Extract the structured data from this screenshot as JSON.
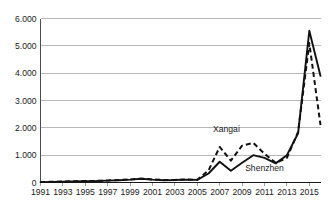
{
  "chart_data": {
    "type": "line",
    "title": "",
    "subtitle": "",
    "xlabel": "",
    "ylabel": "",
    "xlim": [
      1991,
      2016
    ],
    "ylim": [
      0,
      6000
    ],
    "grid": true,
    "grid_axis": "y",
    "legend_position": "inline-annotation",
    "y_ticks": [
      0,
      1000,
      2000,
      3000,
      4000,
      5000,
      6000
    ],
    "y_tick_labels": [
      "0",
      "1.000",
      "2.000",
      "3.000",
      "4.000",
      "5.000",
      "6.000"
    ],
    "x": [
      1991,
      1992,
      1993,
      1994,
      1995,
      1996,
      1997,
      1998,
      1999,
      2000,
      2001,
      2002,
      2003,
      2004,
      2005,
      2006,
      2007,
      2008,
      2009,
      2010,
      2011,
      2012,
      2013,
      2014,
      2015,
      2016
    ],
    "x_tick_labels": [
      "1991",
      "1993",
      "1995",
      "1997",
      "1999",
      "2001",
      "2003",
      "2005",
      "2007",
      "2009",
      "2011",
      "2013",
      "2015"
    ],
    "x_ticks": [
      1991,
      1993,
      1995,
      1997,
      1999,
      2001,
      2003,
      2005,
      2007,
      2009,
      2011,
      2013,
      2015
    ],
    "series": [
      {
        "name": "Xangai",
        "style": "dashed",
        "color": "#111111",
        "values": [
          20,
          25,
          35,
          45,
          55,
          60,
          75,
          90,
          110,
          140,
          110,
          90,
          95,
          110,
          100,
          440,
          1300,
          800,
          1350,
          1450,
          1050,
          720,
          900,
          1850,
          5100,
          2100
        ]
      },
      {
        "name": "Shenzhen",
        "style": "solid",
        "color": "#111111",
        "values": [
          15,
          20,
          30,
          40,
          50,
          55,
          70,
          85,
          105,
          135,
          105,
          85,
          90,
          105,
          95,
          330,
          760,
          430,
          720,
          1000,
          900,
          700,
          1000,
          1800,
          5550,
          3900
        ]
      }
    ],
    "annotations": [
      {
        "text": "Xangai",
        "x": 2007.6,
        "y": 1860
      },
      {
        "text": "Shenzhen",
        "x": 2011.0,
        "y": 430
      }
    ]
  },
  "colors": {
    "background": "#ffffff",
    "gridline": "#9a9a9a",
    "axis": "#4d4d4d",
    "line": "#111111",
    "text": "#1a1a1a"
  }
}
